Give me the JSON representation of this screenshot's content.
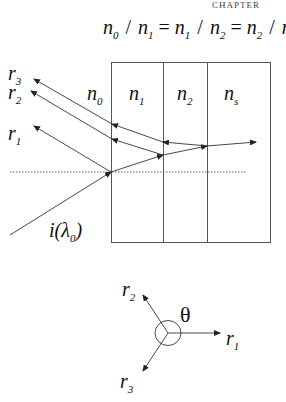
{
  "header": {
    "chapter_label": "CHAPTER"
  },
  "equation": {
    "parts": [
      {
        "base": "n",
        "sub": "0"
      },
      {
        "op": "/"
      },
      {
        "base": "n",
        "sub": "1"
      },
      {
        "op": "="
      },
      {
        "base": "n",
        "sub": "1"
      },
      {
        "op": "/"
      },
      {
        "base": "n",
        "sub": "2"
      },
      {
        "op": "="
      },
      {
        "base": "n",
        "sub": "2"
      },
      {
        "op": "/"
      },
      {
        "base": "n",
        "sub": "s"
      }
    ]
  },
  "layers": [
    {
      "base": "n",
      "sub": "0"
    },
    {
      "base": "n",
      "sub": "1"
    },
    {
      "base": "n",
      "sub": "2"
    },
    {
      "base": "n",
      "sub": "s"
    }
  ],
  "rays": {
    "r1": {
      "base": "r",
      "sub": "1"
    },
    "r2": {
      "base": "r",
      "sub": "2"
    },
    "r3": {
      "base": "r",
      "sub": "3"
    },
    "incident": {
      "base": "i(λ",
      "sub": "0",
      "close": ")"
    }
  },
  "phasor": {
    "angle_label": "θ",
    "r1": {
      "base": "r",
      "sub": "1"
    },
    "r2": {
      "base": "r",
      "sub": "2"
    },
    "r3": {
      "base": "r",
      "sub": "3"
    }
  },
  "colors": {
    "line": "#333333",
    "text": "#111111",
    "background": "#ffffff"
  }
}
